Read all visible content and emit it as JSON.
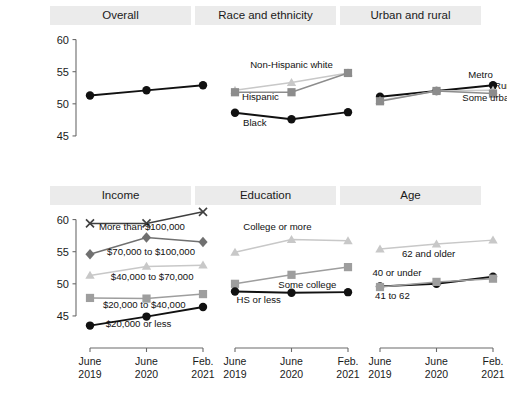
{
  "figure": {
    "ylabel": "Financial well-being",
    "colors": {
      "dark": "#111111",
      "mid": "#8c8c8c",
      "light": "#c8c8c8",
      "panel_header_bg": "#ebebeb",
      "background": "#ffffff"
    }
  },
  "axes": {
    "y_ticks": [
      "45",
      "50",
      "55",
      "60"
    ],
    "y_tick_values": [
      45,
      50,
      55,
      60
    ],
    "ylim": [
      42.5,
      61.8
    ],
    "x_categories": [
      "June 2019",
      "June 2020",
      "Feb. 2021"
    ],
    "x_tick_lines": [
      [
        "June",
        "2019"
      ],
      [
        "June",
        "2020"
      ],
      [
        "Feb.",
        "2021"
      ]
    ],
    "grid": false
  },
  "chart_data": {
    "type": "line",
    "title": "",
    "xlabel": "",
    "ylabel": "Financial well-being",
    "ylim": [
      42.5,
      61.8
    ],
    "x": [
      "June 2019",
      "June 2020",
      "Feb. 2021"
    ],
    "grid": false,
    "legend_position": "inline-labels",
    "panels": [
      {
        "name": "overall",
        "title": "Overall",
        "row": 0,
        "col": 0,
        "show_y_axis": true,
        "show_x_axis": false,
        "series": [
          {
            "name": "Overall",
            "label": "",
            "marker": "circle",
            "color": "#111111",
            "values": [
              51.3,
              52.1,
              52.9
            ],
            "label_dx": 0,
            "label_dy": 0,
            "label_anchor": "middle"
          }
        ]
      },
      {
        "name": "race-and-ethnicity",
        "title": "Race and ethnicity",
        "row": 0,
        "col": 1,
        "show_y_axis": false,
        "show_x_axis": false,
        "series": [
          {
            "name": "Non-Hispanic white",
            "label": "Non-Hispanic white",
            "marker": "triangle",
            "color": "#c8c8c8",
            "values": [
              52.1,
              53.3,
              54.8
            ],
            "label_x": 1.0,
            "label_y": 55.6,
            "label_anchor": "middle"
          },
          {
            "name": "Hispanic",
            "label": "Hispanic",
            "marker": "square",
            "color": "#8c8c8c",
            "values": [
              51.8,
              51.8,
              54.8
            ],
            "label_x": 0.45,
            "label_y": 50.6,
            "label_anchor": "middle"
          },
          {
            "name": "Black",
            "label": "Black",
            "marker": "circle",
            "color": "#111111",
            "values": [
              48.6,
              47.6,
              48.7
            ],
            "label_x": 0.35,
            "label_y": 46.6,
            "label_anchor": "middle"
          }
        ]
      },
      {
        "name": "urban-and-rural",
        "title": "Urban and rural",
        "row": 0,
        "col": 2,
        "show_y_axis": false,
        "show_x_axis": false,
        "series": [
          {
            "name": "Metro",
            "label": "Metro",
            "marker": "circle",
            "color": "#111111",
            "values": [
              51.1,
              52.0,
              52.9
            ],
            "label_x": 1.78,
            "label_y": 54.0,
            "label_anchor": "middle"
          },
          {
            "name": "Rural",
            "label": "Rural",
            "marker": "triangle",
            "color": "#c8c8c8",
            "values": [
              50.5,
              52.0,
              52.1
            ],
            "label_x": 2.22,
            "label_y": 52.3,
            "label_anchor": "middle"
          },
          {
            "name": "Some urban",
            "label": "Some urban",
            "marker": "square",
            "color": "#8c8c8c",
            "values": [
              50.4,
              52.0,
              51.6
            ],
            "label_x": 1.92,
            "label_y": 50.4,
            "label_anchor": "middle"
          }
        ]
      },
      {
        "name": "income",
        "title": "Income",
        "row": 1,
        "col": 0,
        "show_y_axis": true,
        "show_x_axis": true,
        "series": [
          {
            "name": "More than $100,000",
            "label": "More than $100,000",
            "marker": "x",
            "color": "#3f3f3f",
            "values": [
              59.4,
              59.4,
              61.2
            ],
            "label_x": 0.92,
            "label_y": 58.4,
            "label_anchor": "middle"
          },
          {
            "name": "$70,000 to $100,000",
            "label": "$70,000 to $100,000",
            "marker": "diamond",
            "color": "#707070",
            "values": [
              54.6,
              57.2,
              56.5
            ],
            "label_x": 1.08,
            "label_y": 54.5,
            "label_anchor": "middle"
          },
          {
            "name": "$40,000 to $70,000",
            "label": "$40,000 to $70,000",
            "marker": "triangle",
            "color": "#c8c8c8",
            "values": [
              51.3,
              52.7,
              52.9
            ],
            "label_x": 1.1,
            "label_y": 50.6,
            "label_anchor": "middle"
          },
          {
            "name": "$20,000 to $40,000",
            "label": "$20,000 to $40,000",
            "marker": "square",
            "color": "#9e9e9e",
            "values": [
              47.8,
              47.7,
              48.4
            ],
            "label_x": 0.96,
            "label_y": 46.3,
            "label_anchor": "middle"
          },
          {
            "name": "$20,000 or less",
            "label": "$20,000 or less",
            "marker": "circle",
            "color": "#111111",
            "values": [
              43.5,
              44.9,
              46.4
            ],
            "label_x": 0.86,
            "label_y": 43.3,
            "label_anchor": "middle"
          }
        ]
      },
      {
        "name": "education",
        "title": "Education",
        "row": 1,
        "col": 1,
        "show_y_axis": false,
        "show_x_axis": true,
        "series": [
          {
            "name": "College or more",
            "label": "College or more",
            "marker": "triangle",
            "color": "#c8c8c8",
            "values": [
              54.9,
              56.9,
              56.7
            ],
            "label_x": 0.75,
            "label_y": 58.3,
            "label_anchor": "middle"
          },
          {
            "name": "Some college",
            "label": "Some college",
            "marker": "square",
            "color": "#9e9e9e",
            "values": [
              50.0,
              51.4,
              52.6
            ],
            "label_x": 1.28,
            "label_y": 49.3,
            "label_anchor": "middle"
          },
          {
            "name": "HS or less",
            "label": "HS or less",
            "marker": "circle",
            "color": "#111111",
            "values": [
              48.8,
              48.6,
              48.7
            ],
            "label_x": 0.42,
            "label_y": 47.0,
            "label_anchor": "middle"
          }
        ]
      },
      {
        "name": "age",
        "title": "Age",
        "row": 1,
        "col": 2,
        "show_y_axis": false,
        "show_x_axis": true,
        "series": [
          {
            "name": "62 and older",
            "label": "62 and older",
            "marker": "triangle",
            "color": "#c8c8c8",
            "values": [
              55.4,
              56.2,
              56.8
            ],
            "label_x": 0.86,
            "label_y": 54.2,
            "label_anchor": "middle"
          },
          {
            "name": "40 or under",
            "label": "40 or under",
            "marker": "circle",
            "color": "#111111",
            "values": [
              49.6,
              50.0,
              51.1
            ],
            "label_x": 0.3,
            "label_y": 51.2,
            "label_anchor": "middle"
          },
          {
            "name": "41 to 62",
            "label": "41 to 62",
            "marker": "square",
            "color": "#9e9e9e",
            "values": [
              49.5,
              50.3,
              50.8
            ],
            "label_x": 0.22,
            "label_y": 47.6,
            "label_anchor": "middle"
          }
        ]
      }
    ]
  }
}
